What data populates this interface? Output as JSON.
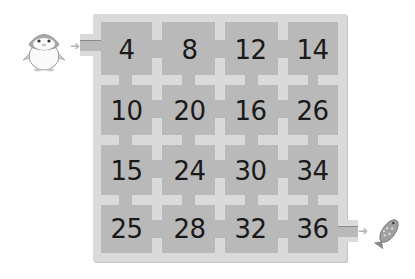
{
  "puzzle": {
    "type": "number-maze",
    "start_character": "penguin",
    "goal_character": "fish",
    "start_arrow": "right-arrow",
    "goal_arrow": "right-arrow"
  },
  "grid": {
    "rows": 4,
    "cols": 4,
    "cells": [
      [
        "4",
        "8",
        "12",
        "14"
      ],
      [
        "10",
        "20",
        "16",
        "26"
      ],
      [
        "15",
        "24",
        "30",
        "34"
      ],
      [
        "25",
        "28",
        "32",
        "36"
      ]
    ]
  },
  "colors": {
    "frame": "#dadada",
    "cell": "#b9b9b9",
    "text": "#1a1a1a",
    "arrow": "#b5b5b5"
  }
}
